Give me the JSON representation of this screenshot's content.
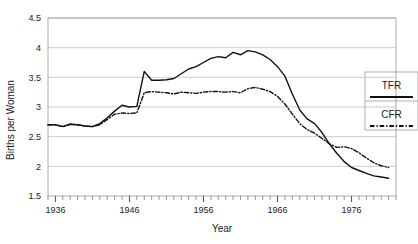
{
  "chart_data": {
    "type": "line",
    "title": "",
    "xlabel": "Year",
    "ylabel": "Births per Woman",
    "xlim": [
      1935,
      1982
    ],
    "ylim": [
      1.5,
      4.5
    ],
    "ytick_labels": [
      "4.5",
      "4",
      "3.5",
      "3",
      "2.5",
      "2",
      "1.5"
    ],
    "ytick_values": [
      4.5,
      4,
      3.5,
      3,
      2.5,
      2,
      1.5
    ],
    "xtick_labels": [
      "1936",
      "1946",
      "1956",
      "1966",
      "1976"
    ],
    "xtick_values": [
      1936,
      1946,
      1956,
      1966,
      1976
    ],
    "minor_tick_interval": 1,
    "grid": "horizontal",
    "legend_position": "right-outside",
    "x": [
      1935,
      1936,
      1937,
      1938,
      1939,
      1940,
      1941,
      1942,
      1943,
      1944,
      1945,
      1946,
      1947,
      1948,
      1949,
      1950,
      1951,
      1952,
      1953,
      1954,
      1955,
      1956,
      1957,
      1958,
      1959,
      1960,
      1961,
      1962,
      1963,
      1964,
      1965,
      1966,
      1967,
      1968,
      1969,
      1970,
      1971,
      1972,
      1973,
      1974,
      1975,
      1976,
      1977,
      1978,
      1979,
      1980,
      1981
    ],
    "series": [
      {
        "name": "TFR",
        "style": "solid",
        "values": [
          2.7,
          2.7,
          2.67,
          2.71,
          2.7,
          2.68,
          2.67,
          2.72,
          2.82,
          2.93,
          3.03,
          3.0,
          3.01,
          3.6,
          3.45,
          3.45,
          3.46,
          3.48,
          3.56,
          3.64,
          3.68,
          3.75,
          3.82,
          3.85,
          3.83,
          3.92,
          3.88,
          3.95,
          3.93,
          3.88,
          3.8,
          3.68,
          3.52,
          3.22,
          2.95,
          2.8,
          2.72,
          2.57,
          2.38,
          2.22,
          2.08,
          1.98,
          1.93,
          1.88,
          1.84,
          1.82,
          1.8
        ]
      },
      {
        "name": "CFR",
        "style": "dash-dot",
        "values": [
          2.7,
          2.7,
          2.67,
          2.71,
          2.7,
          2.68,
          2.67,
          2.7,
          2.79,
          2.88,
          2.9,
          2.89,
          2.9,
          3.24,
          3.26,
          3.25,
          3.24,
          3.22,
          3.25,
          3.24,
          3.23,
          3.25,
          3.26,
          3.26,
          3.25,
          3.26,
          3.24,
          3.31,
          3.33,
          3.3,
          3.26,
          3.18,
          3.05,
          2.88,
          2.72,
          2.62,
          2.56,
          2.47,
          2.38,
          2.32,
          2.33,
          2.3,
          2.23,
          2.14,
          2.06,
          2.01,
          1.98
        ]
      }
    ]
  },
  "legend": {
    "entries": [
      {
        "label": "TFR",
        "style": "solid"
      },
      {
        "label": "CFR",
        "style": "dash-dot"
      }
    ]
  }
}
